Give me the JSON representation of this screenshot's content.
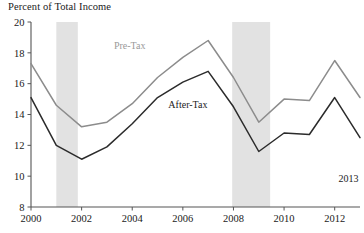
{
  "chart_data": {
    "type": "line",
    "title": "Percent of Total Income",
    "xlabel": "",
    "ylabel": "",
    "ylim": [
      8,
      20
    ],
    "xlim": [
      2000,
      2013
    ],
    "yticks": [
      8,
      10,
      12,
      14,
      16,
      18,
      20
    ],
    "xticks": [
      2000,
      2002,
      2004,
      2006,
      2008,
      2010,
      2012
    ],
    "grid": false,
    "legend_position": "inline-annotation",
    "x": [
      2000,
      2001,
      2002,
      2003,
      2004,
      2005,
      2006,
      2007,
      2008,
      2009,
      2010,
      2011,
      2012,
      2013
    ],
    "series": [
      {
        "name": "Pre-Tax",
        "color": "#8c8c8c",
        "values": [
          17.3,
          14.6,
          13.2,
          13.5,
          14.7,
          16.4,
          17.7,
          18.8,
          16.4,
          13.5,
          15.0,
          14.9,
          17.5,
          15.1
        ]
      },
      {
        "name": "After-Tax",
        "color": "#2b2b2b",
        "values": [
          15.1,
          12.0,
          11.1,
          11.9,
          13.4,
          15.1,
          16.1,
          16.8,
          14.5,
          11.6,
          12.8,
          12.7,
          15.1,
          12.5
        ]
      }
    ],
    "shaded_regions": [
      {
        "name": "recession-2001",
        "start": 2001.0,
        "end": 2001.85,
        "color": "#e2e2e2"
      },
      {
        "name": "recession-2008",
        "start": 2007.95,
        "end": 2009.45,
        "color": "#e2e2e2"
      }
    ],
    "annotations": [
      {
        "name": "pre-tax-label",
        "text": "Pre-Tax",
        "x": 2003.9,
        "y": 18.25,
        "color": "#9a9a9a"
      },
      {
        "name": "after-tax-label",
        "text": "After-Tax",
        "x": 2006.2,
        "y": 14.45,
        "color": "#1a1a1a"
      },
      {
        "name": "end-year-label",
        "text": "2013",
        "x": 2012.55,
        "y": 9.6,
        "color": "#1a1a1a"
      }
    ],
    "axis_color": "#555555"
  }
}
